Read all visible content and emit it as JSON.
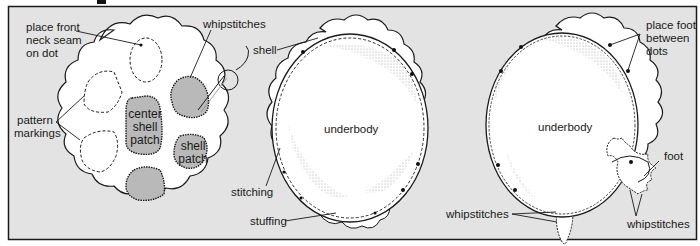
{
  "diagram": {
    "colors": {
      "background": "#e3e3e3",
      "frame": "#1a1a1a",
      "fabric": "#ffffff",
      "patch": "#b9b9b9",
      "stipple": "#a8a8a8"
    },
    "panel1": {
      "labels": {
        "neck_seam": [
          "place front",
          "neck seam",
          "on dot"
        ],
        "whipstitches": "whipstitches",
        "pattern_markings": [
          "pattern",
          "markings"
        ],
        "center_patch": [
          "center",
          "shell",
          "patch"
        ],
        "shell_patch": [
          "shell",
          "patch"
        ]
      }
    },
    "panel2": {
      "labels": {
        "shell": "shell",
        "underbody": "underbody",
        "stitching": "stitching",
        "stuffing": "stuffing"
      }
    },
    "panel3": {
      "labels": {
        "place_foot": [
          "place foot",
          "between",
          "dots"
        ],
        "underbody": "underbody",
        "foot": "foot",
        "whipstitches_left": "whipstitches",
        "whipstitches_right": "whipstitches"
      }
    }
  }
}
